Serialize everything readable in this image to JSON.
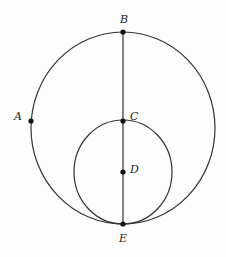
{
  "diagram": {
    "type": "geometry",
    "stroke_color": "#333333",
    "points": [
      {
        "id": "A",
        "label": "A",
        "x": 31,
        "y": 121
      },
      {
        "id": "B",
        "label": "B",
        "x": 123,
        "y": 32
      },
      {
        "id": "C",
        "label": "C",
        "x": 123,
        "y": 121
      },
      {
        "id": "D",
        "label": "D",
        "x": 123,
        "y": 172
      },
      {
        "id": "E",
        "label": "E",
        "x": 123,
        "y": 224
      }
    ],
    "circles": [
      {
        "id": "outer",
        "cx": 123,
        "cy": 128,
        "rx": 92,
        "ry": 96
      },
      {
        "id": "inner",
        "cx": 123,
        "cy": 172,
        "rx": 49,
        "ry": 52
      }
    ],
    "segments": [
      {
        "from": "B",
        "to": "E"
      }
    ]
  }
}
